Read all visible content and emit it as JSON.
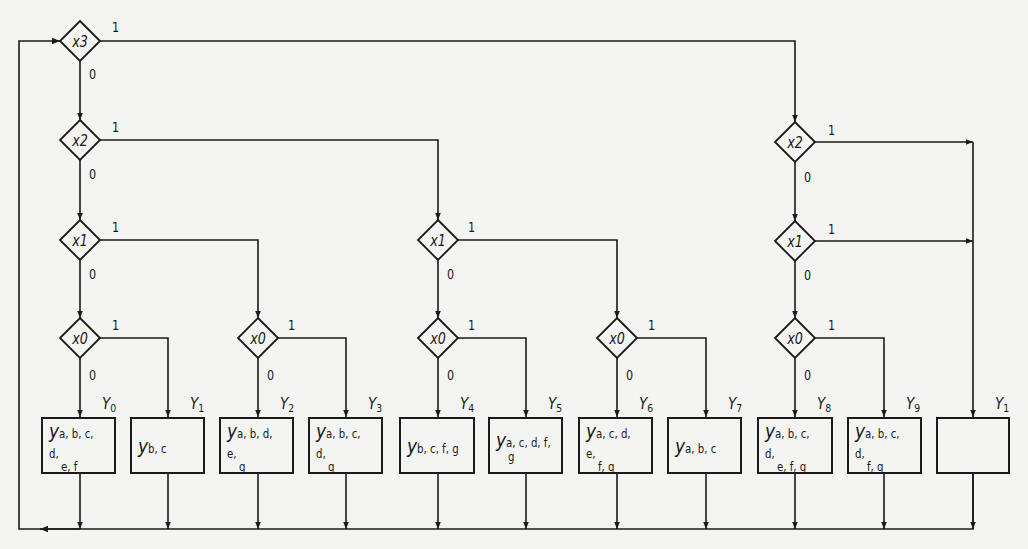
{
  "diagram": {
    "type": "flowchart",
    "decisions": [
      {
        "id": "d_x3",
        "label": "x3",
        "cx": 80,
        "cy": 41
      },
      {
        "id": "d_x2_a",
        "label": "x2",
        "cx": 80,
        "cy": 140
      },
      {
        "id": "d_x1_a",
        "label": "x1",
        "cx": 80,
        "cy": 240
      },
      {
        "id": "d_x0_a",
        "label": "x0",
        "cx": 80,
        "cy": 338
      },
      {
        "id": "d_x0_b",
        "label": "x0",
        "cx": 258,
        "cy": 338
      },
      {
        "id": "d_x1_b",
        "label": "x1",
        "cx": 438,
        "cy": 240
      },
      {
        "id": "d_x0_c",
        "label": "x0",
        "cx": 438,
        "cy": 338
      },
      {
        "id": "d_x0_d",
        "label": "x0",
        "cx": 617,
        "cy": 338
      },
      {
        "id": "d_x2_b",
        "label": "x2",
        "cx": 795,
        "cy": 142
      },
      {
        "id": "d_x1_c",
        "label": "x1",
        "cx": 795,
        "cy": 241
      },
      {
        "id": "d_x0_e",
        "label": "x0",
        "cx": 795,
        "cy": 338
      }
    ],
    "branch_labels": {
      "one": "1",
      "zero": "0"
    },
    "states": [
      {
        "name": "Y",
        "index": "0",
        "cx": 80,
        "output_main": "y",
        "output_line1": "a, b, c, d,",
        "output_line2": "e, f"
      },
      {
        "name": "Y",
        "index": "1",
        "cx": 168,
        "output_main": "y",
        "output_line1": "b, c",
        "output_line2": ""
      },
      {
        "name": "Y",
        "index": "2",
        "cx": 258,
        "output_main": "y",
        "output_line1": "a, b, d, e,",
        "output_line2": "g"
      },
      {
        "name": "Y",
        "index": "3",
        "cx": 346,
        "output_main": "y",
        "output_line1": "a, b, c, d,",
        "output_line2": "g"
      },
      {
        "name": "Y",
        "index": "4",
        "cx": 438,
        "output_main": "y",
        "output_line1": "b, c, f, g",
        "output_line2": ""
      },
      {
        "name": "Y",
        "index": "5",
        "cx": 526,
        "output_main": "y",
        "output_line1": "a, c, d, f,",
        "output_line2": "g"
      },
      {
        "name": "Y",
        "index": "6",
        "cx": 617,
        "output_main": "y",
        "output_line1": "a, c, d, e,",
        "output_line2": "f, g"
      },
      {
        "name": "Y",
        "index": "7",
        "cx": 706,
        "output_main": "y",
        "output_line1": "a, b, c",
        "output_line2": ""
      },
      {
        "name": "Y",
        "index": "8",
        "cx": 795,
        "output_main": "y",
        "output_line1": "a, b, c, d,",
        "output_line2": "e, f, g"
      },
      {
        "name": "Y",
        "index": "9",
        "cx": 884,
        "output_main": "y",
        "output_line1": "a, b, c, d,",
        "output_line2": "f, g"
      },
      {
        "name": "Y",
        "index": "1",
        "cx": 973,
        "output_main": "",
        "output_line1": "",
        "output_line2": ""
      }
    ],
    "colors": {
      "line": "#1a1a1a",
      "background": "#f4f4f2"
    }
  }
}
